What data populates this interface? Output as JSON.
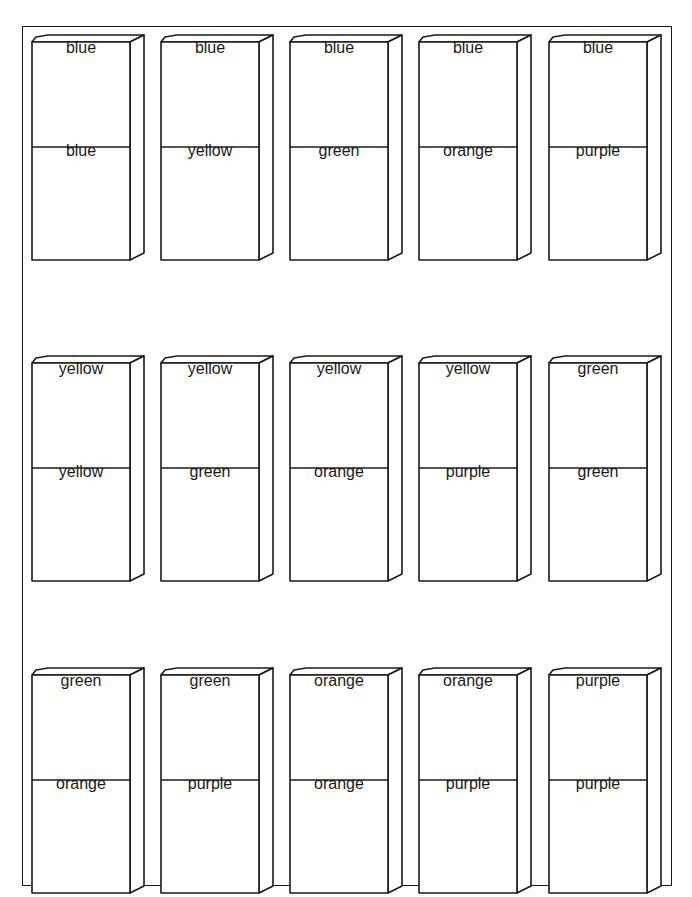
{
  "blocks": [
    {
      "top": "blue",
      "bottom": "blue"
    },
    {
      "top": "blue",
      "bottom": "yellow"
    },
    {
      "top": "blue",
      "bottom": "green"
    },
    {
      "top": "blue",
      "bottom": "orange"
    },
    {
      "top": "blue",
      "bottom": "purple"
    },
    {
      "top": "yellow",
      "bottom": "yellow"
    },
    {
      "top": "yellow",
      "bottom": "green"
    },
    {
      "top": "yellow",
      "bottom": "orange"
    },
    {
      "top": "yellow",
      "bottom": "purple"
    },
    {
      "top": "green",
      "bottom": "green"
    },
    {
      "top": "green",
      "bottom": "orange"
    },
    {
      "top": "green",
      "bottom": "purple"
    },
    {
      "top": "orange",
      "bottom": "orange"
    },
    {
      "top": "orange",
      "bottom": "purple"
    },
    {
      "top": "purple",
      "bottom": "purple"
    }
  ]
}
